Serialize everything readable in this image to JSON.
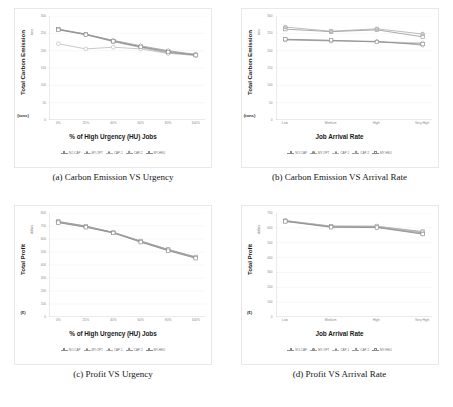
{
  "figure": {
    "background": "#ffffff",
    "bottom_mark": ""
  },
  "series_styles": [
    "s1",
    "s2",
    "s3",
    "s4",
    "s5"
  ],
  "panels": [
    {
      "caption": "(a) Carbon Emission VS Urgency",
      "chart_data": {
        "type": "line",
        "title": "",
        "ylabel": "Total Carbon Emission",
        "ysub": "(tons)",
        "yunit": "tons",
        "xlabel": "% of High Urgency (HU) Jobs",
        "categories": [
          "0%",
          "25%",
          "40%",
          "60%",
          "80%",
          "100%"
        ],
        "yticks": [
          "0",
          "50",
          "100",
          "150",
          "200",
          "250",
          "300"
        ],
        "ylim": [
          0,
          300
        ],
        "grid": true,
        "legend_position": "bottom",
        "series": [
          {
            "name": "NO-CAP",
            "values": [
              262,
              248,
              228,
              212,
              198,
              188
            ]
          },
          {
            "name": "MY-OPT",
            "values": [
              261,
              247,
              226,
              209,
              193,
              186
            ]
          },
          {
            "name": "CAP-1",
            "values": [
              220,
              205,
              210,
              205,
              192,
              190
            ]
          },
          {
            "name": "CAP-2",
            "values": [
              262,
              247,
              230,
              214,
              200,
              189
            ]
          },
          {
            "name": "MY-HEU",
            "values": [
              260,
              246,
              227,
              211,
              196,
              187
            ]
          }
        ]
      }
    },
    {
      "caption": "(b) Carbon Emission VS Arrival Rate",
      "chart_data": {
        "type": "line",
        "title": "",
        "ylabel": "Total Carbon Emission",
        "ysub": "(tons)",
        "yunit": "tons",
        "xlabel": "Job Arrival Rate",
        "categories": [
          "Low",
          "Medium",
          "High",
          "Very High"
        ],
        "yticks": [
          "0",
          "50",
          "100",
          "150",
          "200",
          "250",
          "300"
        ],
        "ylim": [
          0,
          300
        ],
        "grid": true,
        "legend_position": "bottom",
        "series": [
          {
            "name": "NO-CAP",
            "values": [
              262,
              255,
              260,
              240
            ]
          },
          {
            "name": "MY-OPT",
            "values": [
              268,
              256,
              263,
              248
            ]
          },
          {
            "name": "CAP-1",
            "values": [
              232,
              229,
              226,
              222
            ]
          },
          {
            "name": "CAP-2",
            "values": [
              231,
              228,
              227,
              216
            ]
          },
          {
            "name": "MY-HEU",
            "values": [
              233,
              230,
              225,
              219
            ]
          }
        ]
      }
    },
    {
      "caption": "(c) Profit VS Urgency",
      "chart_data": {
        "type": "line",
        "title": "",
        "ylabel": "Total Profit",
        "ysub": "($)",
        "yunit": "dollars",
        "xlabel": "% of High Urgency (HU) Jobs",
        "categories": [
          "0%",
          "25%",
          "40%",
          "60%",
          "80%",
          "100%"
        ],
        "yticks": [
          "0",
          "100",
          "200",
          "300",
          "400",
          "500",
          "600",
          "700",
          "800"
        ],
        "ylim": [
          0,
          800
        ],
        "grid": true,
        "legend_position": "bottom",
        "series": [
          {
            "name": "NO-CAP",
            "values": [
              735,
              700,
              650,
              585,
              520,
              462
            ]
          },
          {
            "name": "MY-OPT",
            "values": [
              728,
              692,
              648,
              578,
              512,
              455
            ]
          },
          {
            "name": "CAP-1",
            "values": [
              730,
              696,
              650,
              582,
              516,
              458
            ]
          },
          {
            "name": "CAP-2",
            "values": [
              733,
              698,
              652,
              583,
              518,
              460
            ]
          },
          {
            "name": "MY-HEU",
            "values": [
              726,
              690,
              646,
              576,
              510,
              452
            ]
          }
        ]
      }
    },
    {
      "caption": "(d) Profit VS Arrival Rate",
      "chart_data": {
        "type": "line",
        "title": "",
        "ylabel": "Total Profit",
        "ysub": "($)",
        "yunit": "dollars",
        "xlabel": "Job Arrival Rate",
        "categories": [
          "Low",
          "Medium",
          "High",
          "Very High"
        ],
        "yticks": [
          "0",
          "100",
          "200",
          "300",
          "400",
          "500",
          "600",
          "700"
        ],
        "ylim": [
          0,
          700
        ],
        "grid": true,
        "legend_position": "bottom",
        "series": [
          {
            "name": "NO-CAP",
            "values": [
              648,
              612,
              610,
              575
            ]
          },
          {
            "name": "MY-OPT",
            "values": [
              645,
              608,
              606,
              560
            ]
          },
          {
            "name": "CAP-1",
            "values": [
              650,
              610,
              612,
              570
            ]
          },
          {
            "name": "CAP-2",
            "values": [
              646,
              606,
              604,
              566
            ]
          },
          {
            "name": "MY-HEU",
            "values": [
              643,
              604,
              602,
              558
            ]
          }
        ]
      }
    }
  ]
}
